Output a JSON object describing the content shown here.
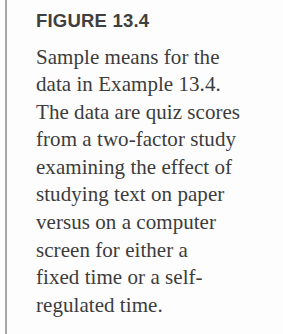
{
  "figure": {
    "title": "FIGURE 13.4",
    "caption_lines": [
      "Sample means for the",
      "data in Example 13.4.",
      "The data are quiz scores",
      "from a two-factor study",
      "examining the effect of",
      "studying text on paper",
      "versus on a computer",
      "screen for either a",
      "fixed time or a self-",
      "regulated time."
    ],
    "caption_text": "Sample means for the data in Example 13.4. The data are quiz scores from a two-factor study examining the effect of studying text on paper versus on a computer screen for either a fixed time or a self-regulated time.",
    "figure_number": "13.4",
    "example_reference": "Example 13.4"
  },
  "colors": {
    "background": "#fdfdfd",
    "title_text": "#3f3f3f",
    "body_text": "#3c3c3c",
    "rule": "#8d8d8d"
  }
}
